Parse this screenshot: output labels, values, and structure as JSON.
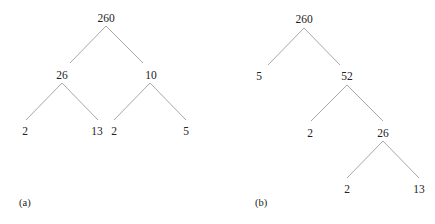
{
  "diagram": {
    "edge_color": "#a8a8a8",
    "trees": [
      {
        "caption": "(a)",
        "caption_pos": [
          19,
          203
        ],
        "nodes": [
          {
            "id": "a_root",
            "label": "260",
            "x": 106,
            "y": 18
          },
          {
            "id": "a_26",
            "label": "26",
            "x": 62,
            "y": 75
          },
          {
            "id": "a_10",
            "label": "10",
            "x": 151,
            "y": 75
          },
          {
            "id": "a_2a",
            "label": "2",
            "x": 25,
            "y": 131
          },
          {
            "id": "a_13",
            "label": "13",
            "x": 97,
            "y": 131
          },
          {
            "id": "a_2b",
            "label": "2",
            "x": 114,
            "y": 131
          },
          {
            "id": "a_5",
            "label": "5",
            "x": 186,
            "y": 131
          }
        ],
        "edges": [
          {
            "x1": 106,
            "y1": 26,
            "x2": 70,
            "y2": 63
          },
          {
            "x1": 106,
            "y1": 26,
            "x2": 143,
            "y2": 63
          },
          {
            "x1": 62,
            "y1": 83,
            "x2": 26,
            "y2": 120
          },
          {
            "x1": 62,
            "y1": 83,
            "x2": 98,
            "y2": 120
          },
          {
            "x1": 150,
            "y1": 83,
            "x2": 114,
            "y2": 120
          },
          {
            "x1": 150,
            "y1": 83,
            "x2": 186,
            "y2": 120
          }
        ]
      },
      {
        "caption": "(b)",
        "caption_pos": [
          255,
          203
        ],
        "nodes": [
          {
            "id": "b_root",
            "label": "260",
            "x": 304,
            "y": 19
          },
          {
            "id": "b_5",
            "label": "5",
            "x": 259,
            "y": 76
          },
          {
            "id": "b_52",
            "label": "52",
            "x": 347,
            "y": 76
          },
          {
            "id": "b_2a",
            "label": "2",
            "x": 310,
            "y": 133
          },
          {
            "id": "b_26",
            "label": "26",
            "x": 383,
            "y": 133
          },
          {
            "id": "b_2b",
            "label": "2",
            "x": 347,
            "y": 189
          },
          {
            "id": "b_13",
            "label": "13",
            "x": 419,
            "y": 189
          }
        ],
        "edges": [
          {
            "x1": 304,
            "y1": 28,
            "x2": 268,
            "y2": 65
          },
          {
            "x1": 304,
            "y1": 28,
            "x2": 340,
            "y2": 65
          },
          {
            "x1": 347,
            "y1": 85,
            "x2": 311,
            "y2": 121
          },
          {
            "x1": 347,
            "y1": 85,
            "x2": 383,
            "y2": 121
          },
          {
            "x1": 383,
            "y1": 141,
            "x2": 347,
            "y2": 178
          },
          {
            "x1": 383,
            "y1": 141,
            "x2": 419,
            "y2": 178
          }
        ]
      }
    ]
  }
}
